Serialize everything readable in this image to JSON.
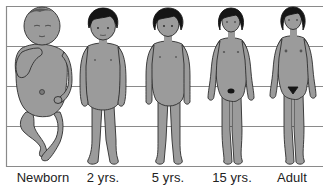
{
  "diagram": {
    "grid_lines_count": 5,
    "colors": {
      "figure_fill": "#9b9b9b",
      "figure_outline": "#2e2e2e",
      "hair": "#151515",
      "grid_line": "#8a8a8a",
      "label_text": "#222222",
      "background": "#ffffff"
    },
    "figures": [
      {
        "id": "newborn",
        "label": "Newborn"
      },
      {
        "id": "age-2",
        "label": "2 yrs."
      },
      {
        "id": "age-5",
        "label": "5 yrs."
      },
      {
        "id": "age-15",
        "label": "15 yrs."
      },
      {
        "id": "adult",
        "label": "Adult"
      }
    ]
  }
}
